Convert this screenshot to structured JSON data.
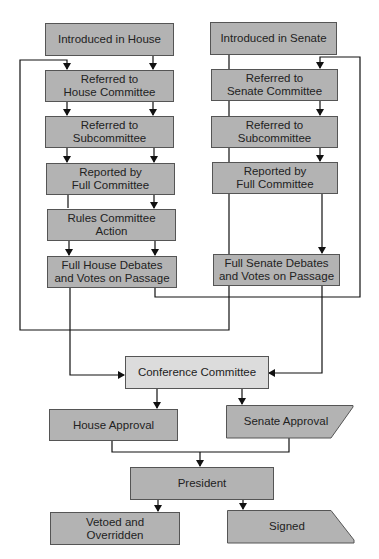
{
  "diagram": {
    "type": "flowchart",
    "colors": {
      "box_fill": "#b3b3b3",
      "conference_fill": "#dcdcdc",
      "border": "#555555",
      "line": "#111111",
      "text": "#222222"
    },
    "house": {
      "introduced": "Introduced in House",
      "committee": "Referred to House Committee",
      "committee_l1": "Referred to",
      "committee_l2": "House Committee",
      "subcommittee_l1": "Referred to",
      "subcommittee_l2": "Subcommittee",
      "reported_l1": "Reported by",
      "reported_l2": "Full Committee",
      "rules_l1": "Rules Committee",
      "rules_l2": "Action",
      "floor_l1": "Full House Debates",
      "floor_l2": "and Votes on Passage"
    },
    "senate": {
      "introduced": "Introduced in Senate",
      "committee_l1": "Referred to",
      "committee_l2": "Senate Committee",
      "subcommittee_l1": "Referred to",
      "subcommittee_l2": "Subcommittee",
      "reported_l1": "Reported by",
      "reported_l2": "Full Committee",
      "floor_l1": "Full Senate Debates",
      "floor_l2": "and Votes on Passage"
    },
    "conference": "Conference Committee",
    "house_approval": "House Approval",
    "senate_approval": "Senate Approval",
    "president": "President",
    "vetoed_l1": "Vetoed and",
    "vetoed_l2": "Overridden",
    "signed": "Signed"
  }
}
